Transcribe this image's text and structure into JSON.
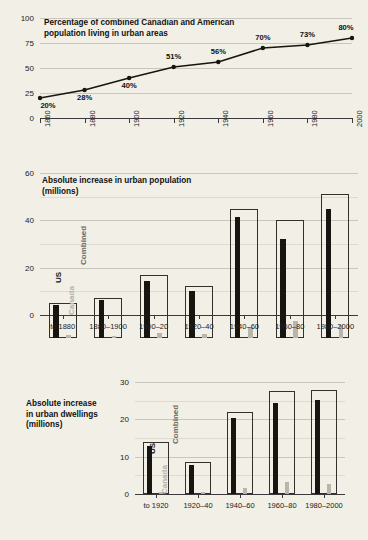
{
  "background_color": "#f1efe6",
  "colors": {
    "us": "#17150f",
    "canada": "#b8b5ab",
    "combined_outline": "#33312c",
    "gridline": "#c9c7bd",
    "axis": "#3a3a3a",
    "text": "#111111"
  },
  "chart_data": [
    {
      "id": "urban-percentage-line",
      "type": "line",
      "title": "Percentage of combined Canadian and American\npopulation living in urban areas",
      "xlabel": "",
      "ylabel": "",
      "ylim": [
        0,
        100
      ],
      "yticks": [
        0,
        25,
        50,
        75,
        100
      ],
      "ytick_labels": [
        "0",
        "25",
        "50",
        "75",
        "100"
      ],
      "grid": true,
      "legend": "none",
      "x": [
        "1860",
        "1880",
        "1900",
        "1920",
        "1940",
        "1960",
        "1980",
        "2000"
      ],
      "categories": [
        "1860",
        "1880",
        "1900",
        "1920",
        "1940",
        "1960",
        "1980",
        "2000"
      ],
      "values": [
        20,
        28,
        40,
        51,
        56,
        70,
        73,
        80
      ],
      "data_labels": [
        "20%",
        "28%",
        "40%",
        "51%",
        "56%",
        "70%",
        "73%",
        "80%"
      ],
      "label_positions": [
        "below",
        "below",
        "below",
        "above",
        "above",
        "above",
        "above",
        "above"
      ]
    },
    {
      "id": "urban-population-bars",
      "type": "bar",
      "title": "Absolute increase in urban population\n(millions)",
      "xlabel": "",
      "ylabel": "",
      "ylim": [
        0,
        60
      ],
      "yticks": [
        0,
        20,
        40,
        60
      ],
      "ytick_labels": [
        "0",
        "20",
        "40",
        "60"
      ],
      "minor_gridlines": [
        10,
        30,
        50
      ],
      "grid": true,
      "legend_position": "inline-first-group",
      "categories": [
        "to 1880",
        "1880–1900",
        "1900–20",
        "1920–40",
        "1940–60",
        "1960–80",
        "1980–2000"
      ],
      "series": [
        {
          "name": "Combined",
          "values": [
            15.0,
            17.0,
            26.5,
            21.8,
            54.5,
            50.0,
            61.0
          ]
        },
        {
          "name": "US",
          "values": [
            13.8,
            16.0,
            24.3,
            19.7,
            51.0,
            42.0,
            54.5
          ]
        },
        {
          "name": "Canada",
          "values": [
            1.4,
            0.9,
            2.3,
            1.9,
            4.8,
            7.2,
            5.6
          ]
        }
      ]
    },
    {
      "id": "urban-dwellings-bars",
      "type": "bar",
      "title": "Absolute increase\nin urban dwellings\n(millions)",
      "xlabel": "",
      "ylabel": "",
      "ylim": [
        0,
        30
      ],
      "yticks": [
        0,
        10,
        20,
        30
      ],
      "ytick_labels": [
        "0",
        "10",
        "20",
        "30"
      ],
      "minor_gridlines": [
        5,
        15,
        25
      ],
      "grid": true,
      "legend_position": "inline-first-group",
      "categories": [
        "to 1920",
        "1920–40",
        "1940–60",
        "1960–80",
        "1980–2000"
      ],
      "series": [
        {
          "name": "Combined",
          "values": [
            14.0,
            8.5,
            22.0,
            27.5,
            28.0
          ]
        },
        {
          "name": "US",
          "values": [
            13.0,
            7.8,
            20.3,
            24.4,
            25.2
          ]
        },
        {
          "name": "Canada",
          "values": [
            0.6,
            0.5,
            1.7,
            3.2,
            2.6
          ]
        }
      ]
    }
  ],
  "legend_labels": {
    "us": "US",
    "combined": "Combined",
    "canada": "Canada"
  }
}
